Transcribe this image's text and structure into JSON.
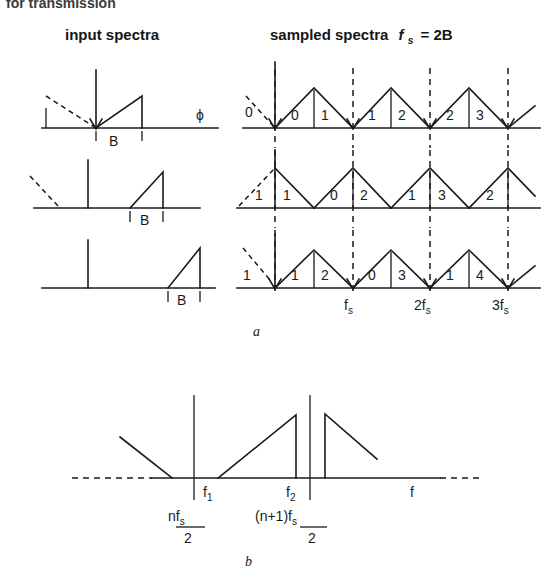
{
  "figure": {
    "top_clipped_text": "for transmission",
    "headings": {
      "left": "input spectra",
      "right_main": "sampled spectra",
      "right_sym": "f",
      "right_sub": "s",
      "right_eq": "= 2B"
    },
    "panel_a_label": "a",
    "panel_b_label": "b"
  },
  "panel_a": {
    "input_rows": [
      {
        "band_label": "B",
        "phi_label": "ϕ"
      },
      {
        "band_label": "B"
      },
      {
        "band_label": "B"
      }
    ],
    "sampled_rows": [
      {
        "outer_label": "0",
        "numbers": [
          "0",
          "1",
          "1",
          "2",
          "2",
          "3"
        ]
      },
      {
        "outer_label": "1",
        "numbers": [
          "1",
          "0",
          "2",
          "1",
          "3",
          "2"
        ]
      },
      {
        "outer_label": "1",
        "numbers": [
          "1",
          "2",
          "0",
          "3",
          "1",
          "4"
        ]
      }
    ],
    "axis_ticks": [
      {
        "sym": "f",
        "sub": "s"
      },
      {
        "sym": "2f",
        "sub": "s"
      },
      {
        "sym": "3f",
        "sub": "s"
      }
    ]
  },
  "panel_b": {
    "tick_f1": {
      "sym": "f",
      "sub": "1"
    },
    "tick_f2": {
      "sym": "f",
      "sub": "2"
    },
    "axis_label": "f",
    "frac_left": {
      "num_main": "nf",
      "num_sub": "s",
      "den": "2"
    },
    "frac_right": {
      "num_main": "(n+1)f",
      "num_sub": "s",
      "den": "2"
    }
  },
  "colors": {
    "ink": "#1a1a1a",
    "paper": "#ffffff"
  }
}
